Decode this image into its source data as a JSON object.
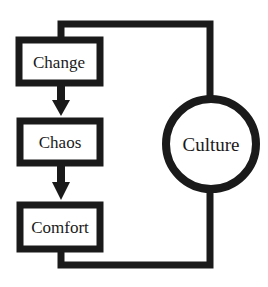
{
  "diagram": {
    "type": "flow-cycle",
    "stroke_color": "#1a1a1a",
    "background": "#ffffff",
    "nodes": [
      {
        "id": "change",
        "label": "Change",
        "shape": "rectangle"
      },
      {
        "id": "chaos",
        "label": "Chaos",
        "shape": "rectangle"
      },
      {
        "id": "comfort",
        "label": "Comfort",
        "shape": "rectangle"
      },
      {
        "id": "culture",
        "label": "Culture",
        "shape": "circle"
      }
    ],
    "edges": [
      {
        "from": "change",
        "to": "chaos",
        "arrow": true
      },
      {
        "from": "chaos",
        "to": "comfort",
        "arrow": true
      },
      {
        "from": "comfort",
        "to": "culture",
        "arrow": false
      },
      {
        "from": "culture",
        "to": "change",
        "arrow": false
      }
    ]
  }
}
